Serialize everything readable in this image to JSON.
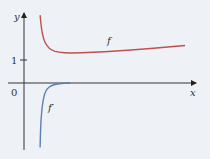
{
  "chart_data": {
    "type": "line",
    "title": "",
    "xlabel": "x",
    "ylabel": "y",
    "x_tick_labels": [],
    "y_tick_labels": [
      "0",
      "1"
    ],
    "y_ticks": [
      0,
      1
    ],
    "xlim": [
      -0.7,
      7.5
    ],
    "ylim": [
      -2.9,
      3.0
    ],
    "grid": false,
    "legend": "none (curves labeled inline)",
    "series": [
      {
        "name": "f",
        "label": "f",
        "color": "#c0504d",
        "description": "decreases steeply from a vertical asymptote, reaches a minimum near y≈1.3, then increases slowly",
        "x": [
          0.7,
          0.75,
          0.85,
          1.0,
          1.2,
          1.5,
          2.0,
          3.0,
          4.0,
          5.0,
          6.0,
          7.0
        ],
        "y": [
          2.95,
          2.4,
          1.9,
          1.6,
          1.42,
          1.33,
          1.3,
          1.33,
          1.39,
          1.46,
          1.54,
          1.63
        ]
      },
      {
        "name": "f'",
        "label": "f′",
        "color": "#5b7fb5",
        "description": "rises steeply from large negative values near the asymptote, approaching 0 from below",
        "x": [
          0.7,
          0.72,
          0.76,
          0.82,
          0.9,
          1.0,
          1.2,
          1.5,
          2.0
        ],
        "y": [
          -2.8,
          -2.0,
          -1.3,
          -0.8,
          -0.45,
          -0.25,
          -0.1,
          -0.03,
          0.0
        ]
      }
    ]
  }
}
